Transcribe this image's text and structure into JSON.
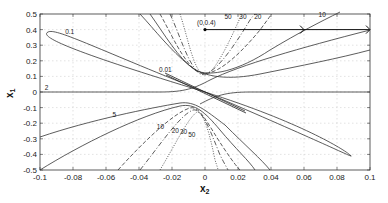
{
  "chart_data": {
    "type": "line",
    "title": "",
    "xlabel": "x2",
    "ylabel": "x1",
    "xlim": [
      -0.1,
      0.1
    ],
    "ylim": [
      -0.5,
      0.5
    ],
    "grid": true,
    "grid_style": "dotted",
    "legend": null,
    "x_ticks": [
      -0.1,
      -0.08,
      -0.06,
      -0.04,
      -0.02,
      0,
      0.02,
      0.04,
      0.06,
      0.08,
      0.1
    ],
    "x_tick_labels": [
      "-0.1",
      "-0.08",
      "-0.06",
      "-0.04",
      "-0.02",
      "0",
      "0.02",
      "0.04",
      "0.06",
      "0.08",
      "0.1"
    ],
    "y_ticks": [
      -0.5,
      -0.4,
      -0.3,
      -0.2,
      -0.1,
      0,
      0.1,
      0.2,
      0.3,
      0.4,
      0.5
    ],
    "y_tick_labels": [
      "-0.5",
      "-0.4",
      "-0.3",
      "-0.2",
      "-0.1",
      "0",
      "0.1",
      "0.2",
      "0.3",
      "0.4",
      "0.5"
    ],
    "contour_levels": [
      0.01,
      0.1,
      2,
      5,
      10,
      20,
      30,
      50
    ],
    "contour_labels": [
      {
        "text": "0.1",
        "x": -0.082,
        "y": 0.37
      },
      {
        "text": "0.01",
        "x": -0.024,
        "y": 0.13
      },
      {
        "text": "2",
        "x": -0.096,
        "y": 0.01
      },
      {
        "text": "5",
        "x": -0.055,
        "y": -0.16
      },
      {
        "text": "10",
        "x": -0.027,
        "y": -0.24
      },
      {
        "text": "20",
        "x": -0.018,
        "y": -0.26
      },
      {
        "text": "30",
        "x": -0.013,
        "y": -0.27
      },
      {
        "text": "50",
        "x": -0.008,
        "y": -0.29
      },
      {
        "text": "50",
        "x": 0.014,
        "y": 0.47
      },
      {
        "text": "30",
        "x": 0.023,
        "y": 0.47
      },
      {
        "text": "20",
        "x": 0.032,
        "y": 0.47
      },
      {
        "text": "10",
        "x": 0.071,
        "y": 0.48
      }
    ],
    "annotations": [
      {
        "text": "(0,0.4)",
        "point": [
          0,
          0.4
        ],
        "type": "marker"
      }
    ],
    "arrow": {
      "from": [
        0,
        0.4
      ],
      "to": [
        0.1,
        0.4
      ],
      "mid_arrow_at": 0.06
    },
    "series": [
      {
        "name": "contour 0.1 (ellipse)",
        "style": "solid",
        "description": "elongated ellipse from (-0.085,0.4) to (0.085,-0.4) through origin"
      },
      {
        "name": "contour 0.01",
        "style": "solid",
        "description": "thin ellipse near origin from (-0.025,0.12) to (0.025,-0.12)"
      },
      {
        "name": "contour 2",
        "style": "solid",
        "description": "near-horizontal line x1≈0 (left) bending to upper right and lower left"
      },
      {
        "name": "contour 5",
        "style": "solid",
        "description": "hyperbola branches"
      },
      {
        "name": "contour 10",
        "style": "solid",
        "description": "hyperbola branches"
      },
      {
        "name": "contour 20",
        "style": "dashed",
        "description": "hyperbola branches"
      },
      {
        "name": "contour 30",
        "style": "dashdot",
        "description": "hyperbola branches"
      },
      {
        "name": "contour 50",
        "style": "dotted",
        "description": "hyperbola branches"
      }
    ]
  }
}
